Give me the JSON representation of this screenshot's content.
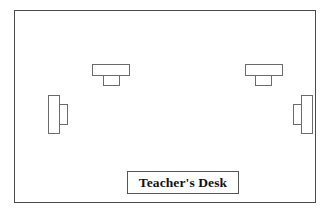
{
  "diagram": {
    "room": {
      "name": "classroom-boundary",
      "shape": "rectangle",
      "border_color": "#4a4a4a",
      "fill_color": "#ffffff"
    },
    "furniture_outline_color": "#6b6b6b",
    "items": [
      {
        "id": "desk-top-left",
        "label": "",
        "type": "student-desk",
        "orientation": "horizontal",
        "position": "top-left",
        "surface": {
          "x": 77,
          "y": 53,
          "w": 38,
          "h": 12
        },
        "chair": {
          "x": 88,
          "y": 64,
          "w": 17,
          "h": 11
        }
      },
      {
        "id": "desk-top-right",
        "label": "",
        "type": "student-desk",
        "orientation": "horizontal",
        "position": "top-right",
        "surface": {
          "x": 230,
          "y": 53,
          "w": 38,
          "h": 12
        },
        "chair": {
          "x": 240,
          "y": 64,
          "w": 17,
          "h": 11
        }
      },
      {
        "id": "desk-left",
        "label": "",
        "type": "student-desk",
        "orientation": "vertical",
        "position": "left",
        "surface": {
          "x": 33,
          "y": 84,
          "w": 12,
          "h": 39
        },
        "chair": {
          "x": 44,
          "y": 93,
          "w": 9,
          "h": 21
        }
      },
      {
        "id": "desk-right",
        "label": "",
        "type": "student-desk",
        "orientation": "vertical",
        "position": "right",
        "surface": {
          "x": 286,
          "y": 84,
          "w": 12,
          "h": 39
        },
        "chair": {
          "x": 278,
          "y": 93,
          "w": 9,
          "h": 21
        }
      }
    ],
    "teacher_desk": {
      "label": "Teacher's Desk",
      "type": "teacher-desk",
      "position": "bottom-center",
      "box": {
        "x": 112,
        "y": 160,
        "w": 112,
        "h": 23
      },
      "text_color": "#111111",
      "border_color": "#555555"
    }
  }
}
